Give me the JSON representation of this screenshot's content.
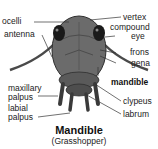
{
  "diagram": {
    "title": "Mandible",
    "subtitle": "(Grasshopper)",
    "labels_left": [
      {
        "id": "ocelli",
        "text": "ocelli"
      },
      {
        "id": "antenna",
        "text": "antenna"
      },
      {
        "id": "maxillary-palpus",
        "text": "maxillary palpus",
        "lines": [
          "maxillary",
          "palpus"
        ]
      },
      {
        "id": "labial-palpus",
        "text": "labial palpus",
        "lines": [
          "labial",
          "palpus"
        ]
      }
    ],
    "labels_right": [
      {
        "id": "vertex",
        "text": "vertex"
      },
      {
        "id": "compound-eye",
        "text": "compound eye",
        "lines": [
          "compound",
          "eye"
        ]
      },
      {
        "id": "frons",
        "text": "frons"
      },
      {
        "id": "gena",
        "text": "gena"
      },
      {
        "id": "mandible",
        "text": "mandible",
        "bold": true
      },
      {
        "id": "clypeus",
        "text": "clypeus"
      },
      {
        "id": "labrum",
        "text": "labrum"
      }
    ],
    "colors": {
      "head_fill": "#6b6b6b",
      "head_dark": "#3a3a3a",
      "eye": "#1a1a1a",
      "line": "#333333",
      "text": "#222222"
    }
  }
}
